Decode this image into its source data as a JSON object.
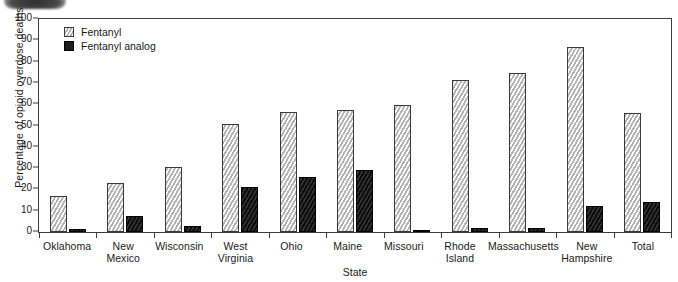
{
  "chart_data": {
    "type": "bar",
    "title": "",
    "xlabel": "State",
    "ylabel": "Percentage of opioid overdose deaths",
    "ylim": [
      0,
      100
    ],
    "ytick_labels": [
      "100",
      "90",
      "80",
      "70",
      "60",
      "50",
      "40",
      "30",
      "20",
      "10",
      "0"
    ],
    "grid": false,
    "legend_position": "top-left",
    "categories": [
      "Oklahoma",
      "New Mexico",
      "Wisconsin",
      "West Virginia",
      "Ohio",
      "Maine",
      "Missouri",
      "Rhode Island",
      "Massachusetts",
      "New Hampshire",
      "Total"
    ],
    "series": [
      {
        "name": "Fentanyl",
        "color": "#c9c9c9",
        "values": [
          17,
          23,
          30.5,
          50.5,
          56.5,
          57.5,
          59.5,
          71.5,
          74.5,
          87,
          56
        ]
      },
      {
        "name": "Fentanyl analog",
        "color": "#1d1d1d",
        "values": [
          1.5,
          7.5,
          3,
          21,
          26,
          29,
          1,
          2,
          2,
          12,
          14
        ]
      }
    ]
  },
  "legend": {
    "items": [
      {
        "label": "Fentanyl",
        "swatch": "light-hatched-swatch"
      },
      {
        "label": "Fentanyl analog",
        "swatch": "dark-swatch"
      }
    ]
  }
}
